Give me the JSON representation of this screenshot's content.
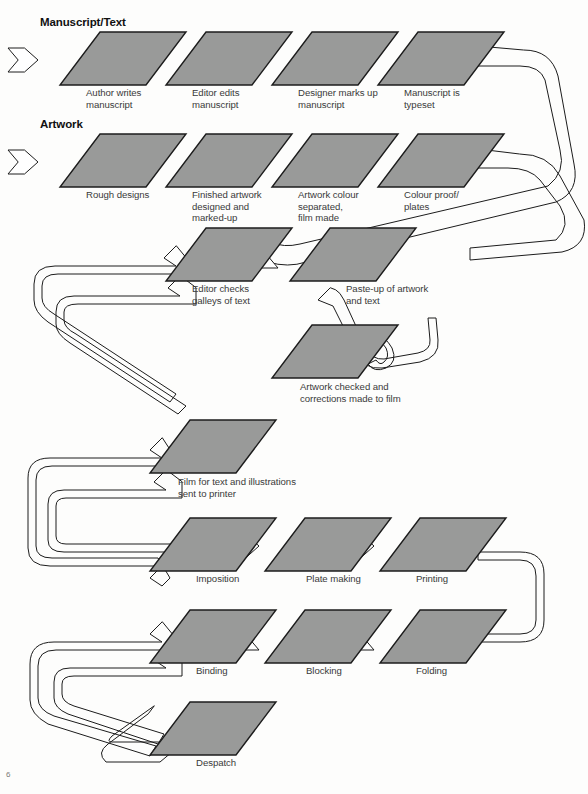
{
  "page": {
    "background": "#fdfdfc",
    "node_fill": "#999a99",
    "node_stroke": "#1c1c1c",
    "connector_stroke": "#1c1c1c",
    "folio": "6"
  },
  "headings": [
    {
      "id": "manuscript-text",
      "label": "Manuscript/Text",
      "x": 40,
      "y": 16
    },
    {
      "id": "artwork",
      "label": "Artwork",
      "x": 40,
      "y": 118
    }
  ],
  "nodes": [
    {
      "id": "author-writes",
      "label": "Author writes\nmanuscript",
      "x": 60,
      "y": 32,
      "cx": 86,
      "cy": 87
    },
    {
      "id": "editor-edits",
      "label": "Editor edits\nmanuscript",
      "x": 166,
      "y": 32,
      "cx": 192,
      "cy": 87
    },
    {
      "id": "designer-marks-up",
      "label": "Designer marks up\nmanuscript",
      "x": 272,
      "y": 32,
      "cx": 298,
      "cy": 87
    },
    {
      "id": "manuscript-typeset",
      "label": "Manuscript is\ntypeset",
      "x": 378,
      "y": 32,
      "cx": 404,
      "cy": 87
    },
    {
      "id": "rough-designs",
      "label": "Rough designs",
      "x": 60,
      "y": 134,
      "cx": 86,
      "cy": 189
    },
    {
      "id": "finished-artwork",
      "label": "Finished artwork\ndesigned and\nmarked-up",
      "x": 166,
      "y": 134,
      "cx": 192,
      "cy": 189
    },
    {
      "id": "artwork-separated",
      "label": "Artwork colour\nseparated,\nfilm made",
      "x": 272,
      "y": 134,
      "cx": 298,
      "cy": 189
    },
    {
      "id": "colour-proof",
      "label": "Colour proof/\nplates",
      "x": 378,
      "y": 134,
      "cx": 404,
      "cy": 189
    },
    {
      "id": "editor-checks",
      "label": "Editor checks\ngalleys of text",
      "x": 166,
      "y": 228,
      "cx": 192,
      "cy": 283
    },
    {
      "id": "paste-up",
      "label": "Paste-up of artwork\nand text",
      "x": 290,
      "y": 228,
      "cx": 346,
      "cy": 283
    },
    {
      "id": "artwork-checked",
      "label": "Artwork checked and\ncorrections made to film",
      "x": 272,
      "y": 325,
      "cx": 300,
      "cy": 381
    },
    {
      "id": "film-sent",
      "label": "Film for text and illustrations\nsent to printer",
      "x": 150,
      "y": 420,
      "cx": 178,
      "cy": 476
    },
    {
      "id": "imposition",
      "label": "Imposition",
      "x": 150,
      "y": 518,
      "cx": 196,
      "cy": 573
    },
    {
      "id": "plate-making",
      "label": "Plate making",
      "x": 265,
      "y": 518,
      "cx": 306,
      "cy": 573
    },
    {
      "id": "printing",
      "label": "Printing",
      "x": 380,
      "y": 518,
      "cx": 416,
      "cy": 573
    },
    {
      "id": "binding",
      "label": "Binding",
      "x": 150,
      "y": 610,
      "cx": 196,
      "cy": 665
    },
    {
      "id": "blocking",
      "label": "Blocking",
      "x": 265,
      "y": 610,
      "cx": 306,
      "cy": 665
    },
    {
      "id": "folding",
      "label": "Folding",
      "x": 380,
      "y": 610,
      "cx": 416,
      "cy": 665
    },
    {
      "id": "despatch",
      "label": "Despatch",
      "x": 150,
      "y": 702,
      "cx": 196,
      "cy": 757
    }
  ],
  "arrows": [
    {
      "id": "arrow-to-author",
      "x": 8,
      "y": 48,
      "dir": "right"
    },
    {
      "id": "arrow-author-to-editor",
      "x": 114,
      "y": 48,
      "dir": "right"
    },
    {
      "id": "arrow-editor-to-designer",
      "x": 220,
      "y": 48,
      "dir": "right"
    },
    {
      "id": "arrow-designer-to-typeset",
      "x": 326,
      "y": 48,
      "dir": "right"
    },
    {
      "id": "arrow-to-rough",
      "x": 8,
      "y": 150,
      "dir": "right"
    },
    {
      "id": "arrow-rough-to-finished",
      "x": 114,
      "y": 150,
      "dir": "right"
    },
    {
      "id": "arrow-finished-to-separated",
      "x": 220,
      "y": 150,
      "dir": "right"
    },
    {
      "id": "arrow-separated-to-proof",
      "x": 326,
      "y": 150,
      "dir": "right"
    },
    {
      "id": "arrow-pasteup-to-galleys",
      "x": 248,
      "y": 244,
      "dir": "left"
    },
    {
      "id": "arrow-plate-to-imposition",
      "x": 229,
      "y": 534,
      "dir": "right"
    },
    {
      "id": "arrow-print-to-plate",
      "x": 344,
      "y": 534,
      "dir": "right"
    },
    {
      "id": "arrow-blocking-to-binding",
      "x": 229,
      "y": 626,
      "dir": "left"
    },
    {
      "id": "arrow-folding-to-blocking",
      "x": 344,
      "y": 626,
      "dir": "left"
    }
  ],
  "connectors": [
    {
      "id": "typeset-to-galleys-ribbon",
      "from": "manuscript-typeset",
      "to": "editor-checks"
    },
    {
      "id": "proof-to-pasteup-ribbon",
      "from": "colour-proof",
      "to": "paste-up"
    },
    {
      "id": "galleys-to-artwork-ribbon",
      "from": "editor-checks",
      "to": "artwork-checked"
    },
    {
      "id": "pasteup-to-artwork-ribbon",
      "from": "paste-up",
      "to": "artwork-checked"
    },
    {
      "id": "artwork-to-film-ribbon",
      "from": "artwork-checked",
      "to": "film-sent"
    },
    {
      "id": "film-to-imposition-ribbon",
      "from": "film-sent",
      "to": "imposition"
    },
    {
      "id": "printing-to-folding-ribbon",
      "from": "printing",
      "to": "folding"
    },
    {
      "id": "binding-to-despatch-ribbon",
      "from": "binding",
      "to": "despatch"
    }
  ]
}
